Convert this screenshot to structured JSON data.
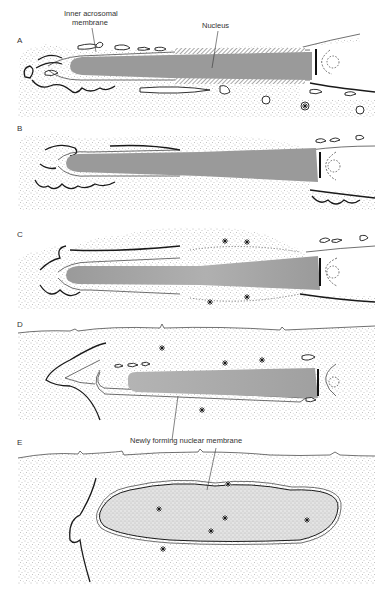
{
  "figure": {
    "colors": {
      "background": "#ffffff",
      "cytoplasm_stipple": "#8a8a8a",
      "nucleus_fill": "#9a9a9a",
      "outline": "#1a1a1a",
      "label_text": "#333333"
    },
    "labels": {
      "inner_acrosomal_membrane_line1": "Inner acrosomal",
      "inner_acrosomal_membrane_line2": "membrane",
      "nucleus": "Nucleus",
      "newly_forming_nuclear_membrane": "Newly forming nuclear membrane"
    },
    "panels": [
      {
        "letter": "A"
      },
      {
        "letter": "B"
      },
      {
        "letter": "C"
      },
      {
        "letter": "D"
      },
      {
        "letter": "E"
      }
    ]
  }
}
